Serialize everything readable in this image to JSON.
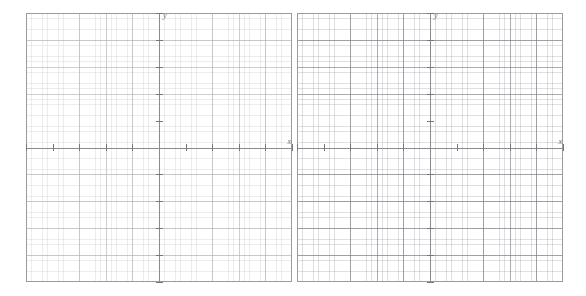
{
  "worksheet": {
    "title": "Blank coordinate grid worksheet",
    "panel_count": 2,
    "background_color": "#ffffff"
  },
  "chart_data": {
    "type": "scatter",
    "title": "",
    "subtitle": "",
    "xlabel": "x",
    "ylabel": "y",
    "grid": true,
    "legend_position": "none",
    "series": [
      {
        "name": "empty",
        "x": [],
        "y": []
      }
    ],
    "panels": [
      {
        "id": "graph-panel-1",
        "xlabel": "x",
        "ylabel": "y",
        "xlim": [
          -5,
          5
        ],
        "ylim": [
          -5,
          5
        ],
        "major_tick_interval": 1,
        "minor_per_major": 5,
        "x_tick_positions": [
          -5,
          -4,
          -3,
          -2,
          -1,
          1,
          2,
          3,
          4,
          5
        ],
        "y_tick_positions": [
          -5,
          -4,
          -3,
          -2,
          -1,
          1,
          2,
          3,
          4,
          5
        ],
        "tick_labels_visible": false,
        "origin_fraction": {
          "x": 0.5,
          "y": 0.5
        }
      },
      {
        "id": "graph-panel-2",
        "xlabel": "x",
        "ylabel": "y",
        "xlim": [
          -5,
          5
        ],
        "ylim": [
          -5,
          5
        ],
        "major_tick_interval": 1,
        "minor_per_major": 5,
        "x_tick_positions": [
          -5,
          -4,
          -3,
          -2,
          -1,
          1,
          2,
          3,
          4,
          5
        ],
        "y_tick_positions": [
          -5,
          -4,
          -3,
          -2,
          -1,
          1,
          2,
          3,
          4,
          5
        ],
        "tick_labels_visible": false,
        "origin_fraction": {
          "x": 0.5,
          "y": 0.5
        }
      }
    ],
    "colors": {
      "minor_grid": "#96969e",
      "major_grid": "#787882",
      "axis": "#8a8a92",
      "border": "#9b9b9e",
      "label": "#6e6e76"
    }
  }
}
